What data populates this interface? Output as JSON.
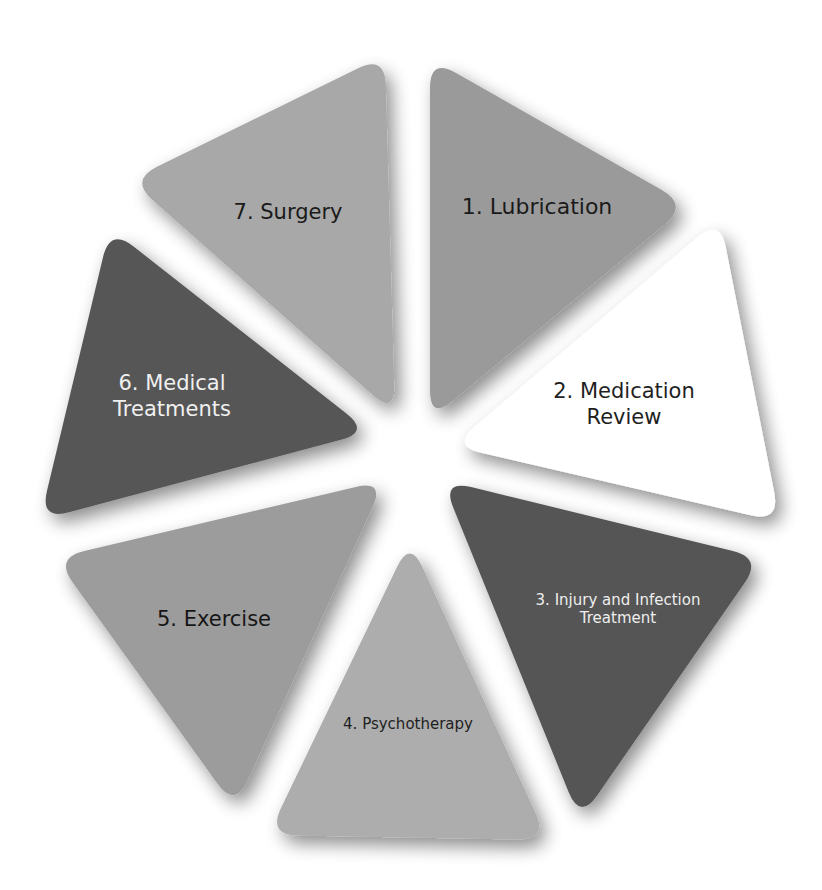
{
  "diagram": {
    "title": "",
    "segments": [
      {
        "id": 1,
        "label_line1": "1. Lubrication",
        "label_line2": "",
        "fill": "#9a9a9a",
        "text_color": "#1a1a1a",
        "points": "430,58 688,205 430,420",
        "label_x": 537,
        "label_y": 207,
        "font_size": 22
      },
      {
        "id": 2,
        "label_line1": "2. Medication",
        "label_line2": "Review",
        "fill": "#ffffff",
        "text_color": "#1f1f1f",
        "points": "720,218 780,522 452,446",
        "label_x": 624,
        "label_y": 405,
        "font_size": 21
      },
      {
        "id": 3,
        "label_line1": "3. Injury and Infection",
        "label_line2": "Treatment",
        "fill": "#555555",
        "text_color": "#eeeeee",
        "points": "442,480 762,558 580,820",
        "label_x": 618,
        "label_y": 609,
        "font_size": 15
      },
      {
        "id": 4,
        "label_line1": "4. Psychotherapy",
        "label_line2": "",
        "fill": "#adadad",
        "text_color": "#1f1f1f",
        "points": "410,540 548,840 268,835",
        "label_x": 408,
        "label_y": 724,
        "font_size": 15
      },
      {
        "id": 5,
        "label_line1": "5. Exercise",
        "label_line2": "",
        "fill": "#9c9c9c",
        "text_color": "#161616",
        "points": "385,480 235,808 55,558",
        "label_x": 214,
        "label_y": 620,
        "font_size": 21
      },
      {
        "id": 6,
        "label_line1": "6. Medical",
        "label_line2": "Treatments",
        "fill": "#575757",
        "text_color": "#f0f0f0",
        "points": "110,228 370,432 40,520",
        "label_x": 172,
        "label_y": 397,
        "font_size": 21
      },
      {
        "id": 7,
        "label_line1": "7. Surgery",
        "label_line2": "",
        "fill": "#a8a8a8",
        "text_color": "#1a1a1a",
        "points": "385,55 395,415 130,180",
        "label_x": 288,
        "label_y": 213,
        "font_size": 21
      }
    ]
  }
}
